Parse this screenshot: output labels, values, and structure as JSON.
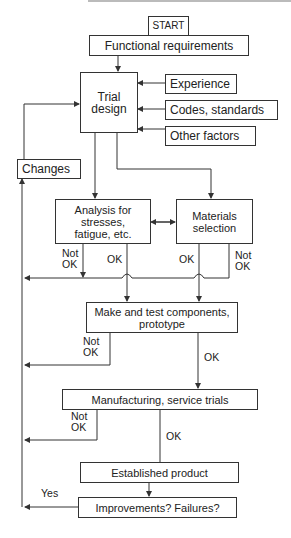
{
  "diagram": {
    "type": "flowchart",
    "nodes": {
      "start": "START",
      "functional": "Functional requirements",
      "trial": "Trial design",
      "experience": "Experience",
      "codes": "Codes, standards",
      "other": "Other factors",
      "changes": "Changes",
      "analysis": "Analysis for stresses, fatigue, etc.",
      "materials": "Materials selection",
      "make": "Make and test components, prototype",
      "manufacturing": "Manufacturing, service trials",
      "established": "Established product",
      "improvements": "Improvements? Failures?"
    },
    "labels": {
      "not_ok_1": "Not OK",
      "ok_1": "OK",
      "ok_2": "OK",
      "not_ok_2": "Not OK",
      "not_ok_3": "Not OK",
      "ok_3": "OK",
      "not_ok_4": "Not OK",
      "ok_4": "OK",
      "yes": "Yes"
    },
    "colors": {
      "line": "#333333",
      "background": "#ffffff"
    }
  }
}
